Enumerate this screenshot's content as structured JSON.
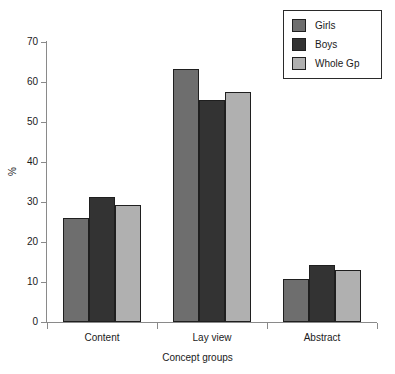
{
  "chart_data": {
    "type": "bar",
    "title": "",
    "xlabel": "Concept groups",
    "ylabel": "%",
    "categories": [
      "Content",
      "Lay view",
      "Abstract"
    ],
    "series": [
      {
        "name": "Girls",
        "color": "#6e6e6e",
        "values": [
          26.0,
          63.3,
          10.7
        ]
      },
      {
        "name": "Boys",
        "color": "#333333",
        "values": [
          31.2,
          55.5,
          14.2
        ]
      },
      {
        "name": "Whole Gp",
        "color": "#b0b0b0",
        "values": [
          29.3,
          57.5,
          13.0
        ]
      }
    ],
    "ylim": [
      0,
      70
    ],
    "yticks": [
      0,
      10,
      20,
      30,
      40,
      50,
      60,
      70
    ],
    "ytick_labels": [
      "0",
      "10",
      "20",
      "30",
      "40",
      "50",
      "60",
      "70"
    ],
    "grid": false,
    "legend_position": "top-right"
  },
  "legend": {
    "entries": [
      {
        "label": "Girls"
      },
      {
        "label": "Boys"
      },
      {
        "label": "Whole Gp"
      }
    ]
  }
}
